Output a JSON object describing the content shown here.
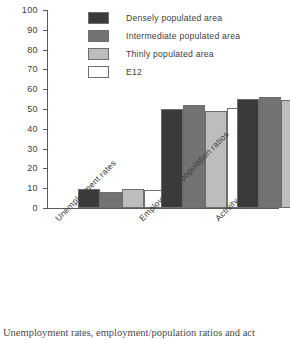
{
  "chart_data": {
    "type": "bar",
    "title": "",
    "xlabel": "",
    "ylabel": "",
    "ylim": [
      0,
      100
    ],
    "ytick_step": 10,
    "yticks": [
      0,
      10,
      20,
      30,
      40,
      50,
      60,
      70,
      80,
      90,
      100
    ],
    "grid": false,
    "legend_position": "top-right-inside",
    "categories": [
      "Unemployment rates",
      "Employment / population ratios",
      "Activity rates"
    ],
    "series": [
      {
        "name": "Densely populated area",
        "color": "#3a3a3a",
        "values": [
          9.7,
          50.0,
          55.2
        ]
      },
      {
        "name": "Intermediate populated area",
        "color": "#737373",
        "values": [
          8.0,
          51.8,
          56.2
        ]
      },
      {
        "name": "Thinly populated area",
        "color": "#bdbdbd",
        "values": [
          9.6,
          49.2,
          54.5
        ]
      },
      {
        "name": "E12",
        "color": "#ffffff",
        "values": [
          9.2,
          50.3,
          55.4
        ]
      }
    ]
  },
  "legend": {
    "items": [
      {
        "label": "Densely populated area",
        "color": "#3a3a3a"
      },
      {
        "label": "Intermediate populated area",
        "color": "#737373"
      },
      {
        "label": "Thinly populated area",
        "color": "#bdbdbd"
      },
      {
        "label": "E12",
        "color": "#ffffff"
      }
    ]
  },
  "caption": {
    "text": "Unemployment rates, employment/population ratios and act"
  }
}
